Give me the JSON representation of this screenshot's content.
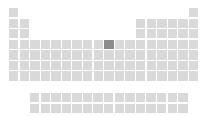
{
  "app": {
    "title": "Periodic Table",
    "view": "periodic table grid"
  },
  "colors": {
    "background": "#ffffff",
    "cell": "#d9d9d9",
    "cell_selected": "#8b8b8b"
  },
  "layout": {
    "width": 208,
    "height": 117,
    "cell_size": 9.4,
    "pitch_x": 10.58,
    "pitch_y": 10.55,
    "origin_x": 9,
    "origin_y": 8,
    "f_block_origin_x": 30,
    "f_block_origin_y": 93,
    "f_block_pitch_y": 10.8
  },
  "selection": {
    "symbol": "Ni",
    "name": "Nickel",
    "atomic_number": 28,
    "group": 10,
    "period": 4
  },
  "main_grid": {
    "columns": 18,
    "rows": 7,
    "description": "main periodic table block, groups 1-18, periods 1-7",
    "cells": [
      {
        "group": 1,
        "period": 1,
        "symbol": "H",
        "number": 1,
        "selected": false
      },
      {
        "group": 18,
        "period": 1,
        "symbol": "He",
        "number": 2,
        "selected": false
      },
      {
        "group": 1,
        "period": 2,
        "symbol": "Li",
        "number": 3,
        "selected": false
      },
      {
        "group": 2,
        "period": 2,
        "symbol": "Be",
        "number": 4,
        "selected": false
      },
      {
        "group": 13,
        "period": 2,
        "symbol": "B",
        "number": 5,
        "selected": false
      },
      {
        "group": 14,
        "period": 2,
        "symbol": "C",
        "number": 6,
        "selected": false
      },
      {
        "group": 15,
        "period": 2,
        "symbol": "N",
        "number": 7,
        "selected": false
      },
      {
        "group": 16,
        "period": 2,
        "symbol": "O",
        "number": 8,
        "selected": false
      },
      {
        "group": 17,
        "period": 2,
        "symbol": "F",
        "number": 9,
        "selected": false
      },
      {
        "group": 18,
        "period": 2,
        "symbol": "Ne",
        "number": 10,
        "selected": false
      },
      {
        "group": 1,
        "period": 3,
        "symbol": "Na",
        "number": 11,
        "selected": false
      },
      {
        "group": 2,
        "period": 3,
        "symbol": "Mg",
        "number": 12,
        "selected": false
      },
      {
        "group": 13,
        "period": 3,
        "symbol": "Al",
        "number": 13,
        "selected": false
      },
      {
        "group": 14,
        "period": 3,
        "symbol": "Si",
        "number": 14,
        "selected": false
      },
      {
        "group": 15,
        "period": 3,
        "symbol": "P",
        "number": 15,
        "selected": false
      },
      {
        "group": 16,
        "period": 3,
        "symbol": "S",
        "number": 16,
        "selected": false
      },
      {
        "group": 17,
        "period": 3,
        "symbol": "Cl",
        "number": 17,
        "selected": false
      },
      {
        "group": 18,
        "period": 3,
        "symbol": "Ar",
        "number": 18,
        "selected": false
      },
      {
        "group": 1,
        "period": 4,
        "symbol": "K",
        "number": 19,
        "selected": false
      },
      {
        "group": 2,
        "period": 4,
        "symbol": "Ca",
        "number": 20,
        "selected": false
      },
      {
        "group": 3,
        "period": 4,
        "symbol": "Sc",
        "number": 21,
        "selected": false
      },
      {
        "group": 4,
        "period": 4,
        "symbol": "Ti",
        "number": 22,
        "selected": false
      },
      {
        "group": 5,
        "period": 4,
        "symbol": "V",
        "number": 23,
        "selected": false
      },
      {
        "group": 6,
        "period": 4,
        "symbol": "Cr",
        "number": 24,
        "selected": false
      },
      {
        "group": 7,
        "period": 4,
        "symbol": "Mn",
        "number": 25,
        "selected": false
      },
      {
        "group": 8,
        "period": 4,
        "symbol": "Fe",
        "number": 26,
        "selected": false
      },
      {
        "group": 9,
        "period": 4,
        "symbol": "Co",
        "number": 27,
        "selected": false
      },
      {
        "group": 10,
        "period": 4,
        "symbol": "Ni",
        "number": 28,
        "selected": true
      },
      {
        "group": 11,
        "period": 4,
        "symbol": "Cu",
        "number": 29,
        "selected": false
      },
      {
        "group": 12,
        "period": 4,
        "symbol": "Zn",
        "number": 30,
        "selected": false
      },
      {
        "group": 13,
        "period": 4,
        "symbol": "Ga",
        "number": 31,
        "selected": false
      },
      {
        "group": 14,
        "period": 4,
        "symbol": "Ge",
        "number": 32,
        "selected": false
      },
      {
        "group": 15,
        "period": 4,
        "symbol": "As",
        "number": 33,
        "selected": false
      },
      {
        "group": 16,
        "period": 4,
        "symbol": "Se",
        "number": 34,
        "selected": false
      },
      {
        "group": 17,
        "period": 4,
        "symbol": "Br",
        "number": 35,
        "selected": false
      },
      {
        "group": 18,
        "period": 4,
        "symbol": "Kr",
        "number": 36,
        "selected": false
      },
      {
        "group": 1,
        "period": 5,
        "symbol": "Rb",
        "number": 37,
        "selected": false
      },
      {
        "group": 2,
        "period": 5,
        "symbol": "Sr",
        "number": 38,
        "selected": false
      },
      {
        "group": 3,
        "period": 5,
        "symbol": "Y",
        "number": 39,
        "selected": false
      },
      {
        "group": 4,
        "period": 5,
        "symbol": "Zr",
        "number": 40,
        "selected": false
      },
      {
        "group": 5,
        "period": 5,
        "symbol": "Nb",
        "number": 41,
        "selected": false
      },
      {
        "group": 6,
        "period": 5,
        "symbol": "Mo",
        "number": 42,
        "selected": false
      },
      {
        "group": 7,
        "period": 5,
        "symbol": "Tc",
        "number": 43,
        "selected": false
      },
      {
        "group": 8,
        "period": 5,
        "symbol": "Ru",
        "number": 44,
        "selected": false
      },
      {
        "group": 9,
        "period": 5,
        "symbol": "Rh",
        "number": 45,
        "selected": false
      },
      {
        "group": 10,
        "period": 5,
        "symbol": "Pd",
        "number": 46,
        "selected": false
      },
      {
        "group": 11,
        "period": 5,
        "symbol": "Ag",
        "number": 47,
        "selected": false
      },
      {
        "group": 12,
        "period": 5,
        "symbol": "Cd",
        "number": 48,
        "selected": false
      },
      {
        "group": 13,
        "period": 5,
        "symbol": "In",
        "number": 49,
        "selected": false
      },
      {
        "group": 14,
        "period": 5,
        "symbol": "Sn",
        "number": 50,
        "selected": false
      },
      {
        "group": 15,
        "period": 5,
        "symbol": "Sb",
        "number": 51,
        "selected": false
      },
      {
        "group": 16,
        "period": 5,
        "symbol": "Te",
        "number": 52,
        "selected": false
      },
      {
        "group": 17,
        "period": 5,
        "symbol": "I",
        "number": 53,
        "selected": false
      },
      {
        "group": 18,
        "period": 5,
        "symbol": "Xe",
        "number": 54,
        "selected": false
      },
      {
        "group": 1,
        "period": 6,
        "symbol": "Cs",
        "number": 55,
        "selected": false
      },
      {
        "group": 2,
        "period": 6,
        "symbol": "Ba",
        "number": 56,
        "selected": false
      },
      {
        "group": 3,
        "period": 6,
        "symbol": "La",
        "number": 57,
        "selected": false
      },
      {
        "group": 4,
        "period": 6,
        "symbol": "Hf",
        "number": 72,
        "selected": false
      },
      {
        "group": 5,
        "period": 6,
        "symbol": "Ta",
        "number": 73,
        "selected": false
      },
      {
        "group": 6,
        "period": 6,
        "symbol": "W",
        "number": 74,
        "selected": false
      },
      {
        "group": 7,
        "period": 6,
        "symbol": "Re",
        "number": 75,
        "selected": false
      },
      {
        "group": 8,
        "period": 6,
        "symbol": "Os",
        "number": 76,
        "selected": false
      },
      {
        "group": 9,
        "period": 6,
        "symbol": "Ir",
        "number": 77,
        "selected": false
      },
      {
        "group": 10,
        "period": 6,
        "symbol": "Pt",
        "number": 78,
        "selected": false
      },
      {
        "group": 11,
        "period": 6,
        "symbol": "Au",
        "number": 79,
        "selected": false
      },
      {
        "group": 12,
        "period": 6,
        "symbol": "Hg",
        "number": 80,
        "selected": false
      },
      {
        "group": 13,
        "period": 6,
        "symbol": "Tl",
        "number": 81,
        "selected": false
      },
      {
        "group": 14,
        "period": 6,
        "symbol": "Pb",
        "number": 82,
        "selected": false
      },
      {
        "group": 15,
        "period": 6,
        "symbol": "Bi",
        "number": 83,
        "selected": false
      },
      {
        "group": 16,
        "period": 6,
        "symbol": "Po",
        "number": 84,
        "selected": false
      },
      {
        "group": 17,
        "period": 6,
        "symbol": "At",
        "number": 85,
        "selected": false
      },
      {
        "group": 18,
        "period": 6,
        "symbol": "Rn",
        "number": 86,
        "selected": false
      },
      {
        "group": 1,
        "period": 7,
        "symbol": "Fr",
        "number": 87,
        "selected": false
      },
      {
        "group": 2,
        "period": 7,
        "symbol": "Ra",
        "number": 88,
        "selected": false
      },
      {
        "group": 3,
        "period": 7,
        "symbol": "Ac",
        "number": 89,
        "selected": false
      },
      {
        "group": 4,
        "period": 7,
        "symbol": "Rf",
        "number": 104,
        "selected": false
      },
      {
        "group": 5,
        "period": 7,
        "symbol": "Db",
        "number": 105,
        "selected": false
      },
      {
        "group": 6,
        "period": 7,
        "symbol": "Sg",
        "number": 106,
        "selected": false
      },
      {
        "group": 7,
        "period": 7,
        "symbol": "Bh",
        "number": 107,
        "selected": false
      },
      {
        "group": 8,
        "period": 7,
        "symbol": "Hs",
        "number": 108,
        "selected": false
      },
      {
        "group": 9,
        "period": 7,
        "symbol": "Mt",
        "number": 109,
        "selected": false
      },
      {
        "group": 10,
        "period": 7,
        "symbol": "Ds",
        "number": 110,
        "selected": false
      },
      {
        "group": 11,
        "period": 7,
        "symbol": "Rg",
        "number": 111,
        "selected": false
      },
      {
        "group": 12,
        "period": 7,
        "symbol": "Cn",
        "number": 112,
        "selected": false
      },
      {
        "group": 13,
        "period": 7,
        "symbol": "Nh",
        "number": 113,
        "selected": false
      },
      {
        "group": 14,
        "period": 7,
        "symbol": "Fl",
        "number": 114,
        "selected": false
      },
      {
        "group": 15,
        "period": 7,
        "symbol": "Mc",
        "number": 115,
        "selected": false
      },
      {
        "group": 16,
        "period": 7,
        "symbol": "Lv",
        "number": 116,
        "selected": false
      },
      {
        "group": 17,
        "period": 7,
        "symbol": "Ts",
        "number": 117,
        "selected": false
      },
      {
        "group": 18,
        "period": 7,
        "symbol": "Og",
        "number": 118,
        "selected": false
      }
    ]
  },
  "f_block": {
    "columns": 15,
    "rows": 2,
    "description": "detached lanthanide and actinide rows below the main block",
    "rows_data": [
      {
        "name": "lanthanides",
        "row": 1,
        "cells": [
          {
            "col": 1,
            "symbol": "La",
            "number": 57,
            "selected": false
          },
          {
            "col": 2,
            "symbol": "Ce",
            "number": 58,
            "selected": false
          },
          {
            "col": 3,
            "symbol": "Pr",
            "number": 59,
            "selected": false
          },
          {
            "col": 4,
            "symbol": "Nd",
            "number": 60,
            "selected": false
          },
          {
            "col": 5,
            "symbol": "Pm",
            "number": 61,
            "selected": false
          },
          {
            "col": 6,
            "symbol": "Sm",
            "number": 62,
            "selected": false
          },
          {
            "col": 7,
            "symbol": "Eu",
            "number": 63,
            "selected": false
          },
          {
            "col": 8,
            "symbol": "Gd",
            "number": 64,
            "selected": false
          },
          {
            "col": 9,
            "symbol": "Tb",
            "number": 65,
            "selected": false
          },
          {
            "col": 10,
            "symbol": "Dy",
            "number": 66,
            "selected": false
          },
          {
            "col": 11,
            "symbol": "Ho",
            "number": 67,
            "selected": false
          },
          {
            "col": 12,
            "symbol": "Er",
            "number": 68,
            "selected": false
          },
          {
            "col": 13,
            "symbol": "Tm",
            "number": 69,
            "selected": false
          },
          {
            "col": 14,
            "symbol": "Yb",
            "number": 70,
            "selected": false
          },
          {
            "col": 15,
            "symbol": "Lu",
            "number": 71,
            "selected": false
          }
        ]
      },
      {
        "name": "actinides",
        "row": 2,
        "cells": [
          {
            "col": 1,
            "symbol": "Ac",
            "number": 89,
            "selected": false
          },
          {
            "col": 2,
            "symbol": "Th",
            "number": 90,
            "selected": false
          },
          {
            "col": 3,
            "symbol": "Pa",
            "number": 91,
            "selected": false
          },
          {
            "col": 4,
            "symbol": "U",
            "number": 92,
            "selected": false
          },
          {
            "col": 5,
            "symbol": "Np",
            "number": 93,
            "selected": false
          },
          {
            "col": 6,
            "symbol": "Pu",
            "number": 94,
            "selected": false
          },
          {
            "col": 7,
            "symbol": "Am",
            "number": 95,
            "selected": false
          },
          {
            "col": 8,
            "symbol": "Cm",
            "number": 96,
            "selected": false
          },
          {
            "col": 9,
            "symbol": "Bk",
            "number": 97,
            "selected": false
          },
          {
            "col": 10,
            "symbol": "Cf",
            "number": 98,
            "selected": false
          },
          {
            "col": 11,
            "symbol": "Es",
            "number": 99,
            "selected": false
          },
          {
            "col": 12,
            "symbol": "Fm",
            "number": 100,
            "selected": false
          },
          {
            "col": 13,
            "symbol": "Md",
            "number": 101,
            "selected": false
          },
          {
            "col": 14,
            "symbol": "No",
            "number": 102,
            "selected": false
          },
          {
            "col": 15,
            "symbol": "Lr",
            "number": 103,
            "selected": false
          }
        ]
      }
    ]
  }
}
